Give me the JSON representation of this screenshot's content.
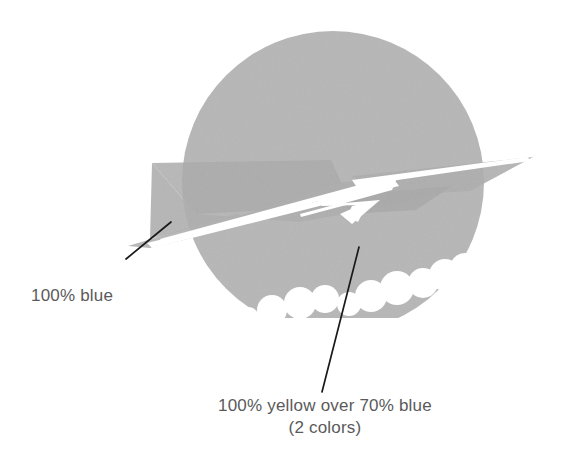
{
  "figure": {
    "background_color": "#ffffff",
    "colors": {
      "circle_gray": "#b6b6b6",
      "wing_gray": "#b0b0b0",
      "overlap_gray": "#a8a8a8",
      "white": "#ffffff",
      "leader_line": "#1a1a1a",
      "caption_text": "#5a5a5a"
    },
    "shapes": {
      "circle": {
        "name": "background-circle",
        "center_x": 333,
        "center_y": 182,
        "radius": 151,
        "fill": "#b6b6b6"
      },
      "scallops": {
        "name": "cloud-scallop-mask",
        "description": "white overlapping circles masking the lower edge of the gray circle",
        "fill": "#ffffff"
      },
      "wing": {
        "name": "swoosh-wing-shape",
        "description": "angular arrow / bird wing form crossing the circle",
        "fill": "#b0b0b0"
      },
      "white_swooshes": {
        "name": "white-swoosh-lines",
        "description": "white tapered stripes and chevron arrowhead",
        "fill": "#ffffff"
      }
    },
    "leader_lines": [
      {
        "name": "leader-line-blue",
        "x1": 126,
        "y1": 259,
        "x2": 171,
        "y2": 222,
        "width": 1.6,
        "color": "#1a1a1a"
      },
      {
        "name": "leader-line-yellow",
        "x1": 322,
        "y1": 392,
        "x2": 359,
        "y2": 247,
        "width": 1.6,
        "color": "#1a1a1a"
      }
    ]
  },
  "captions": {
    "blue": {
      "label": "100% blue"
    },
    "yellow": {
      "line1": "100% yellow over 70% blue",
      "line2": "(2 colors)"
    }
  }
}
